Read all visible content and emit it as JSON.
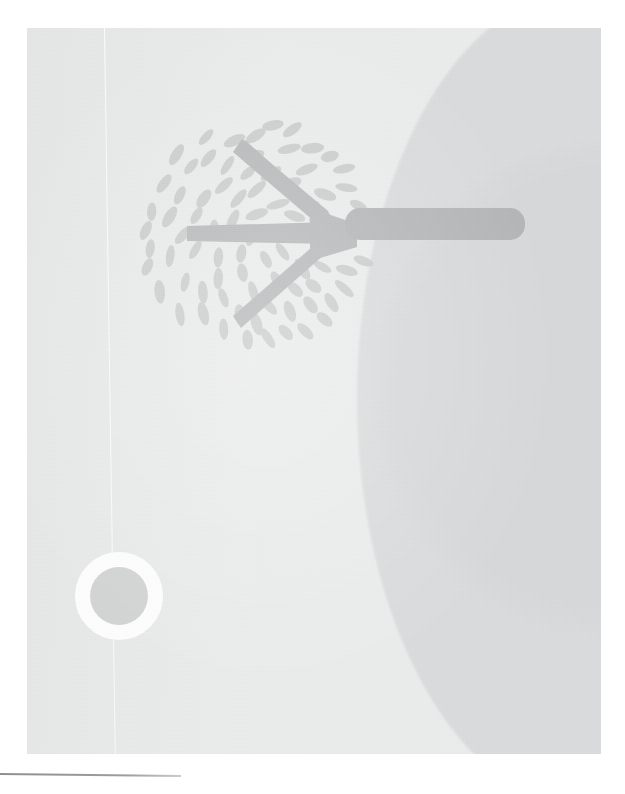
{
  "page": {
    "width": 625,
    "height": 794,
    "background_color": "#ffffff",
    "kind": "scanned-illustration-page"
  },
  "plate": {
    "label": "scanned artwork plate",
    "x": 27,
    "y": 28,
    "width": 574,
    "height": 726,
    "paper_color": "#e9eaea",
    "shade_color": "#d9dadb"
  },
  "artwork": {
    "title": "Stylized tree and sun",
    "tree": {
      "label": "tree",
      "foliage_label": "leaf canopy",
      "leaf_color": "#c9cbcb",
      "leaf_count": 96,
      "canopy_center_x": 228,
      "canopy_center_y": 205,
      "canopy_radius": 112,
      "branch_color": "#b6b8b9",
      "trunk_color": "#b3b5b6",
      "trunk_label": "horizontal trunk",
      "orientation": "rotated-90-trunk-points-right"
    },
    "sun": {
      "label": "sun",
      "center_x": 119,
      "center_y": 596,
      "disc_radius": 29,
      "ray_outer_radius": 44,
      "ray_count": 15,
      "disc_color": "#d2d4d4",
      "ray_color": "#fdfdfd"
    },
    "curve": {
      "label": "large curved field",
      "color": "#d9dadb"
    },
    "fold_line": {
      "label": "vertical scan fold line",
      "color": "#ffffff"
    }
  },
  "footer": {
    "rule_label": "bottom horizontal rule",
    "rule_color": "#8d8f91",
    "rule_width": 181
  }
}
